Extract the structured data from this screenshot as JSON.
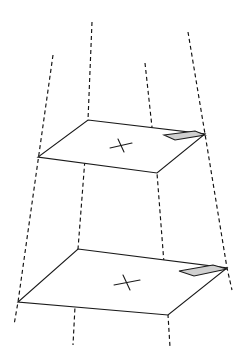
{
  "figure": {
    "background_color": "#ffffff",
    "stroke_color": "#1a1a1a",
    "shaded_cell_color": "#d0d0d0",
    "dash_pattern": "4 3"
  },
  "planes": [
    {
      "name": "upper-plane",
      "label": "upper plane",
      "points": "88,120 205,134 157,173 38,157",
      "tick_mark": {
        "name": "congruence-tick-upper",
        "bar": "110,148 132,143",
        "slash": "118,139 124,152"
      },
      "shaded_cell": {
        "name": "shaded-cell-upper",
        "points": "165,134 196,130 205,134 174,139",
        "color": "#d0d0d0",
        "points_full": "164,135 195,131 205,135 175,140"
      }
    },
    {
      "name": "lower-plane",
      "label": "lower plane",
      "points": "78,249 227,268 168,315 18,302",
      "tick_mark": {
        "name": "congruence-tick-lower",
        "bar": "114,285 140,280",
        "slash": "123,275 130,290"
      },
      "shaded_cell": {
        "name": "shaded-cell-lower",
        "points": "180,270 214,264 227,268 193,275",
        "color": "#d0d0d0",
        "points_full": "179,271 213,265 227,269 194,276"
      }
    }
  ],
  "rays": [
    {
      "name": "projection-ray-1",
      "label": "ray through left corners",
      "path": "M53,55 L18,302 L14,325"
    },
    {
      "name": "projection-ray-2",
      "label": "ray through top corners",
      "path": "M92,22 L88,120 L78,249 L73,345"
    },
    {
      "name": "projection-ray-3",
      "label": "ray through bottom corners",
      "path": "M145,63 L157,173 L168,315 L170,347"
    },
    {
      "name": "projection-ray-4",
      "label": "ray through right corners",
      "path": "M188,32 L205,134 L227,268 L232,290"
    }
  ]
}
